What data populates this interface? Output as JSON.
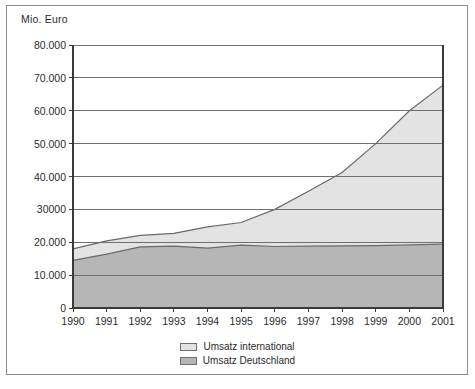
{
  "chart_data": {
    "type": "area",
    "stacked": true,
    "title": "",
    "ylabel": "Mio. Euro",
    "xlabel": "",
    "grid": true,
    "legend_position": "bottom",
    "ylim": [
      0,
      80000
    ],
    "xlim": [
      1990,
      2001
    ],
    "categories": [
      1990,
      1991,
      1992,
      1993,
      1994,
      1995,
      1996,
      1997,
      1998,
      1999,
      2000,
      2001
    ],
    "x_tick_labels": [
      "1990",
      "1991",
      "1992",
      "1993",
      "1994",
      "1995",
      "1996",
      "1997",
      "1998",
      "1999",
      "2000",
      "2001"
    ],
    "y_tick_values": [
      0,
      10000,
      20000,
      30000,
      40000,
      50000,
      60000,
      70000,
      80000
    ],
    "y_tick_labels": [
      "0",
      "10.000",
      "20.000",
      "30000",
      "40.000",
      "50.000",
      "60.000",
      "70.000",
      "80.000"
    ],
    "series": [
      {
        "name": "Umsatz Deutschland",
        "color": "#b6b6b6",
        "line_color": "#6a6a6a",
        "values": [
          14500,
          16400,
          18600,
          18800,
          18200,
          19100,
          18700,
          18800,
          18900,
          19000,
          19200,
          19400
        ]
      },
      {
        "name": "Umsatz international",
        "color": "#e3e3e3",
        "line_color": "#6a6a6a",
        "values": [
          3500,
          4000,
          3500,
          3900,
          6500,
          6900,
          11300,
          16700,
          22300,
          31000,
          40800,
          48400
        ]
      }
    ],
    "totals": [
      18000,
      20400,
      22100,
      22700,
      24700,
      26000,
      30000,
      35500,
      41200,
      50000,
      60000,
      67800
    ]
  },
  "legend": {
    "entries": [
      {
        "label": "Umsatz international",
        "color": "#e3e3e3"
      },
      {
        "label": "Umsatz Deutschland",
        "color": "#b6b6b6"
      }
    ]
  },
  "colors": {
    "frame": "#8d8d8d",
    "axis": "#3a3a3a",
    "grid": "#6f6f6f",
    "text": "#2b2b2b",
    "international_fill": "#e3e3e3",
    "deutschland_fill": "#b6b6b6",
    "series_line": "#6a6a6a",
    "background": "#ffffff"
  }
}
